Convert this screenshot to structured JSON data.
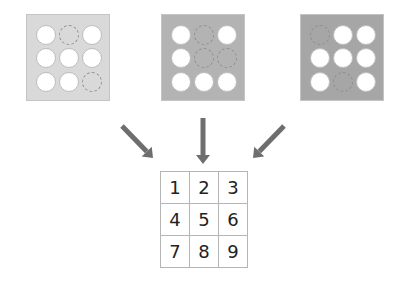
{
  "panels": [
    {
      "name": "panel-1",
      "left": 26,
      "color": "#d9d9d9",
      "holes": [
        "open",
        "closed",
        "open",
        "open",
        "open",
        "open",
        "open",
        "open",
        "closed"
      ]
    },
    {
      "name": "panel-2",
      "left": 161,
      "color": "#b3b3b3",
      "holes": [
        "open",
        "closed",
        "open",
        "open",
        "closed",
        "closed",
        "open",
        "open",
        "open"
      ]
    },
    {
      "name": "panel-3",
      "left": 300,
      "color": "#a6a6a6",
      "holes": [
        "closed",
        "open",
        "open",
        "open",
        "open",
        "open",
        "open",
        "closed",
        "open"
      ]
    }
  ],
  "arrows": [
    {
      "name": "arrow-left-diagonal",
      "x1": 122,
      "y1": 126,
      "x2": 153,
      "y2": 158
    },
    {
      "name": "arrow-center-down",
      "x1": 203,
      "y1": 118,
      "x2": 203,
      "y2": 164
    },
    {
      "name": "arrow-right-diagonal",
      "x1": 284,
      "y1": 126,
      "x2": 253,
      "y2": 158
    }
  ],
  "arrow_color": "#6e6e6e",
  "grid": {
    "rows": [
      [
        "1",
        "2",
        "3"
      ],
      [
        "4",
        "5",
        "6"
      ],
      [
        "7",
        "8",
        "9"
      ]
    ]
  }
}
